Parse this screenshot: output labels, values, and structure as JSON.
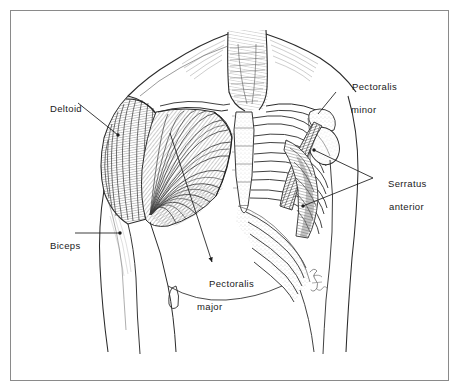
{
  "figure": {
    "title": "Anterior chest and shoulder musculature",
    "medium": "pen-and-ink anatomical illustration",
    "signature": "artist-signature",
    "border_color": "#8a8a8a",
    "ink_color": "#1a1a1a",
    "background_color": "#ffffff",
    "shading_color": "#6e6e6e"
  },
  "labels": [
    {
      "id": "deltoid",
      "name": "Deltoid",
      "line1": "Deltoid",
      "line2": "",
      "x": 38,
      "y": 91,
      "leader": {
        "from_x": 78,
        "from_y": 103,
        "to_x": 118,
        "to_y": 135,
        "marker": "dot"
      }
    },
    {
      "id": "biceps",
      "name": "Biceps",
      "line1": "Biceps",
      "line2": "",
      "x": 38,
      "y": 228,
      "leader": {
        "from_x": 75,
        "from_y": 233,
        "to_x": 120,
        "to_y": 233,
        "marker": "dot"
      }
    },
    {
      "id": "pectoralis-major",
      "name": "Pectoralis major",
      "line1": "Pectoralis",
      "line2": "major",
      "x": 197,
      "y": 266,
      "leader": {
        "from_x": 170,
        "from_y": 133,
        "to_x": 212,
        "to_y": 262,
        "marker": "arrow"
      }
    },
    {
      "id": "pectoralis-minor",
      "name": "Pectoralis minor",
      "line1": "Pectoralis",
      "line2": "minor",
      "x": 340,
      "y": 69,
      "leader": {
        "from_x": 336,
        "from_y": 92,
        "to_x": 318,
        "to_y": 114,
        "marker": "none"
      }
    },
    {
      "id": "serratus-anterior",
      "name": "Serratus anterior",
      "line1": "Serratus",
      "line2": "anterior",
      "x": 376,
      "y": 166,
      "leader": {
        "from_x": 373,
        "from_y": 178,
        "to_x": 314,
        "to_y": 150,
        "marker": "dot"
      },
      "leader2": {
        "from_x": 373,
        "from_y": 178,
        "to_x": 303,
        "to_y": 206,
        "marker": "dot"
      }
    }
  ],
  "structures": [
    "neck",
    "sternocleidomastoid",
    "clavicle",
    "sternum",
    "ribs",
    "costal cartilage",
    "scapula",
    "humerus head",
    "deltoid",
    "pectoralis major",
    "pectoralis minor",
    "serratus anterior",
    "biceps brachii",
    "abdomen",
    "navel"
  ]
}
